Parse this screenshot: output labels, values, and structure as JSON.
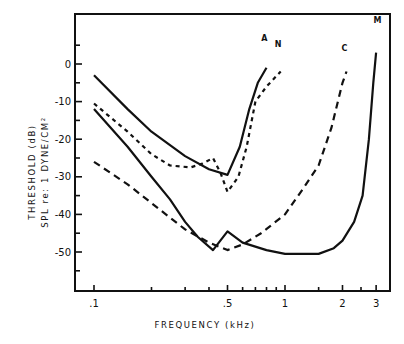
{
  "chart_data": {
    "type": "line",
    "title": "",
    "xlabel": "FREQUENCY (kHz)",
    "ylabel_line1": "THRESHOLD (dB)",
    "ylabel_line2": "SPL re: 1 DYNE/CM²",
    "xscale": "log",
    "xlim": [
      0.085,
      3.6
    ],
    "ylim": [
      -60,
      13
    ],
    "grid": false,
    "legend": "inline curve labels",
    "x_ticks": [
      {
        "value": 0.1,
        "label": ".1"
      },
      {
        "value": 0.2,
        "label": ""
      },
      {
        "value": 0.3,
        "label": ""
      },
      {
        "value": 0.4,
        "label": ""
      },
      {
        "value": 0.5,
        "label": ".5"
      },
      {
        "value": 0.6,
        "label": ""
      },
      {
        "value": 0.7,
        "label": ""
      },
      {
        "value": 0.8,
        "label": ""
      },
      {
        "value": 0.9,
        "label": ""
      },
      {
        "value": 1.0,
        "label": "1"
      },
      {
        "value": 1.5,
        "label": ""
      },
      {
        "value": 2.0,
        "label": "2"
      },
      {
        "value": 2.5,
        "label": ""
      },
      {
        "value": 3.0,
        "label": "3"
      }
    ],
    "y_ticks": [
      {
        "value": 5,
        "label": ""
      },
      {
        "value": 0,
        "label": "0"
      },
      {
        "value": -5,
        "label": ""
      },
      {
        "value": -10,
        "label": "-10"
      },
      {
        "value": -15,
        "label": ""
      },
      {
        "value": -20,
        "label": "-20"
      },
      {
        "value": -25,
        "label": ""
      },
      {
        "value": -30,
        "label": "-30"
      },
      {
        "value": -35,
        "label": ""
      },
      {
        "value": -40,
        "label": "-40"
      },
      {
        "value": -45,
        "label": ""
      },
      {
        "value": -50,
        "label": "-50"
      },
      {
        "value": -55,
        "label": ""
      }
    ],
    "series": [
      {
        "name": "A",
        "style": "solid",
        "x": [
          0.1,
          0.15,
          0.2,
          0.3,
          0.4,
          0.5,
          0.58,
          0.65,
          0.72,
          0.8
        ],
        "y": [
          -3,
          -12,
          -18,
          -24.5,
          -28,
          -29.5,
          -22,
          -12,
          -5,
          -1
        ]
      },
      {
        "name": "N",
        "style": "dotted",
        "x": [
          0.1,
          0.15,
          0.2,
          0.25,
          0.32,
          0.37,
          0.42,
          0.46,
          0.5,
          0.57,
          0.63,
          0.7,
          0.8,
          0.95
        ],
        "y": [
          -10.5,
          -18,
          -24,
          -27,
          -27.5,
          -26.5,
          -25,
          -29,
          -34,
          -30,
          -22,
          -10,
          -6,
          -2
        ]
      },
      {
        "name": "C",
        "style": "dashed",
        "x": [
          0.1,
          0.15,
          0.2,
          0.3,
          0.4,
          0.5,
          0.6,
          0.75,
          1.0,
          1.25,
          1.5,
          1.75,
          2.0,
          2.1
        ],
        "y": [
          -26,
          -32,
          -37,
          -44,
          -47.5,
          -49.5,
          -48,
          -45,
          -40,
          -33,
          -27,
          -17,
          -5,
          -2
        ]
      },
      {
        "name": "M",
        "style": "solid",
        "x": [
          0.1,
          0.15,
          0.2,
          0.25,
          0.3,
          0.35,
          0.42,
          0.5,
          0.6,
          0.8,
          1.0,
          1.5,
          1.8,
          2.0,
          2.3,
          2.55,
          2.75,
          2.9,
          3.0
        ],
        "y": [
          -12,
          -22,
          -30,
          -36,
          -42,
          -46,
          -49.5,
          -44.5,
          -47.5,
          -49.5,
          -50.5,
          -50.5,
          -49,
          -47,
          -42,
          -35,
          -20,
          -5,
          3
        ]
      }
    ],
    "annotations": [
      {
        "text": "A",
        "x": 0.78,
        "y": 6
      },
      {
        "text": "N",
        "x": 0.92,
        "y": 4.5
      },
      {
        "text": "C",
        "x": 2.05,
        "y": 3.5
      },
      {
        "text": "M",
        "x": 3.05,
        "y": 11
      }
    ]
  },
  "layout": {
    "plot_left": 75,
    "plot_right": 390,
    "plot_top": 14,
    "plot_bottom": 291,
    "x0_freq": 0.1,
    "x0_px": 94,
    "px_per_decade": 191,
    "y0_px": 64,
    "px_per_db": 3.76
  }
}
